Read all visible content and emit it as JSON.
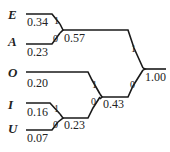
{
  "diagram": {
    "type": "huffman-tree",
    "leaves": [
      {
        "symbol": "E",
        "prob": "0.34",
        "bit": "1"
      },
      {
        "symbol": "A",
        "prob": "0.23",
        "bit": "0"
      },
      {
        "symbol": "O",
        "prob": "0.20",
        "bit": "1"
      },
      {
        "symbol": "I",
        "prob": "0.16",
        "bit": "1"
      },
      {
        "symbol": "U",
        "prob": "0.07",
        "bit": "0"
      }
    ],
    "internal": [
      {
        "id": "EA",
        "prob": "0.57",
        "bit": "1"
      },
      {
        "id": "IU",
        "prob": "0.23",
        "bit": "0"
      },
      {
        "id": "OIU",
        "prob": "0.43",
        "bit": "0"
      },
      {
        "id": "root",
        "prob": "1.00"
      }
    ]
  }
}
